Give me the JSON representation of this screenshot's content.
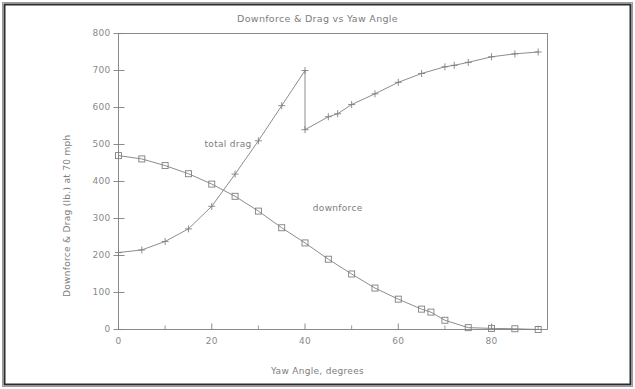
{
  "figure": {
    "title": "Downforce & Drag vs Yaw Angle",
    "border_color": "#2b2b2b",
    "background": "#ffffff",
    "ink_color": "#7f7f7f"
  },
  "chart_data": {
    "type": "line",
    "title": "Downforce & Drag vs Yaw Angle",
    "xlabel": "Yaw Angle, degrees",
    "ylabel": "Downforce & Drag (lb.) at 70 mph",
    "xlim": [
      0,
      92
    ],
    "ylim": [
      0,
      800
    ],
    "xticks": [
      0,
      20,
      40,
      60,
      80
    ],
    "xticklabels": [
      "0",
      "20",
      "40",
      "60",
      "80"
    ],
    "xminorticks": [
      10,
      30,
      50,
      70,
      90
    ],
    "yticks": [
      0,
      100,
      200,
      300,
      400,
      500,
      600,
      700,
      800
    ],
    "yticklabels": [
      "0",
      "100",
      "200",
      "300",
      "400",
      "500",
      "600",
      "700",
      "800"
    ],
    "grid": false,
    "legend_position": "inline-annotations",
    "annotations": [
      {
        "text": "total drag",
        "x": 23.5,
        "y": 500,
        "name": "total-drag-label"
      },
      {
        "text": "downforce",
        "x": 47.0,
        "y": 325,
        "name": "downforce-label"
      }
    ],
    "series": [
      {
        "name": "total drag",
        "marker": "plus",
        "values": [
          {
            "x": 0,
            "y": 208
          },
          {
            "x": 5,
            "y": 215
          },
          {
            "x": 10,
            "y": 238
          },
          {
            "x": 15,
            "y": 272
          },
          {
            "x": 20,
            "y": 333
          },
          {
            "x": 25,
            "y": 420
          },
          {
            "x": 30,
            "y": 510
          },
          {
            "x": 35,
            "y": 605
          },
          {
            "x": 40,
            "y": 700
          },
          {
            "x": 40,
            "y": 540
          },
          {
            "x": 45,
            "y": 575
          },
          {
            "x": 47,
            "y": 583
          },
          {
            "x": 50,
            "y": 608
          },
          {
            "x": 55,
            "y": 637
          },
          {
            "x": 60,
            "y": 668
          },
          {
            "x": 65,
            "y": 692
          },
          {
            "x": 70,
            "y": 710
          },
          {
            "x": 72,
            "y": 714
          },
          {
            "x": 75,
            "y": 722
          },
          {
            "x": 80,
            "y": 737
          },
          {
            "x": 85,
            "y": 745
          },
          {
            "x": 90,
            "y": 750
          }
        ]
      },
      {
        "name": "downforce",
        "marker": "square",
        "values": [
          {
            "x": 0,
            "y": 470
          },
          {
            "x": 5,
            "y": 461
          },
          {
            "x": 10,
            "y": 443
          },
          {
            "x": 15,
            "y": 421
          },
          {
            "x": 20,
            "y": 393
          },
          {
            "x": 25,
            "y": 360
          },
          {
            "x": 30,
            "y": 320
          },
          {
            "x": 35,
            "y": 275
          },
          {
            "x": 40,
            "y": 234
          },
          {
            "x": 45,
            "y": 190
          },
          {
            "x": 50,
            "y": 150
          },
          {
            "x": 55,
            "y": 112
          },
          {
            "x": 60,
            "y": 82
          },
          {
            "x": 65,
            "y": 55
          },
          {
            "x": 67,
            "y": 47
          },
          {
            "x": 70,
            "y": 25
          },
          {
            "x": 75,
            "y": 5
          },
          {
            "x": 80,
            "y": 3
          },
          {
            "x": 85,
            "y": 2
          },
          {
            "x": 90,
            "y": 0
          }
        ]
      }
    ]
  }
}
